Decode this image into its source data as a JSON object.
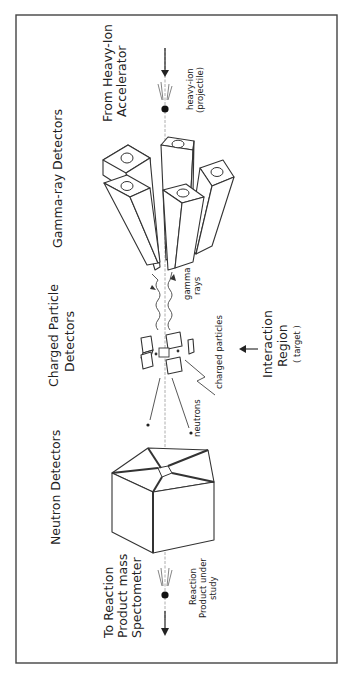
{
  "diagram": {
    "orientation": "rotated 90 degrees counter-clockwise",
    "labels": {
      "source": [
        "From Heavy-Ion",
        "Accelerator"
      ],
      "projectile": [
        "heavy-ion",
        "(projectile)"
      ],
      "gamma_detectors": "Gamma-ray Detectors",
      "gamma_rays": [
        "gamma",
        "rays"
      ],
      "charged_detectors": [
        "Charged Particle",
        "Detectors"
      ],
      "charged_particles": "charged particles",
      "neutrons": "neutrons",
      "interaction": [
        "Interaction",
        "Region"
      ],
      "target": "( target )",
      "neutron_detectors": "Neutron Detectors",
      "destination": [
        "To Reaction",
        "Product mass",
        "Spectometer"
      ],
      "reaction_product": [
        "Reaction",
        "Product under",
        "study"
      ]
    },
    "components": [
      {
        "name": "Gamma-ray Detectors",
        "shape": "cluster of 6 hexagonal-bore rectangular prisms"
      },
      {
        "name": "Charged Particle Detectors",
        "shape": "small plates around target"
      },
      {
        "name": "Neutron Detectors",
        "shape": "pentagonal segmented block with central bore"
      }
    ],
    "flow": [
      "From Heavy-Ion Accelerator",
      "Interaction Region (target)",
      "To Reaction Product mass Spectometer"
    ]
  }
}
